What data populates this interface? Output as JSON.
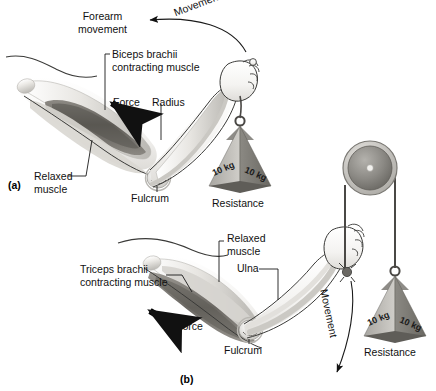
{
  "figure": {
    "background": "#ffffff",
    "ink": "#111111"
  },
  "panels": [
    {
      "id": "a",
      "label": "(a)",
      "description": "Biceps brachii contracting, forearm flexion, weight held in hand",
      "labels": [
        {
          "name": "forearm-movement",
          "text": "Forearm\nmovement"
        },
        {
          "name": "movement-arrow-label",
          "text": "Movement"
        },
        {
          "name": "biceps-brachii",
          "text": "Biceps brachii\ncontracting muscle"
        },
        {
          "name": "force",
          "text": "Force"
        },
        {
          "name": "radius",
          "text": "Radius"
        },
        {
          "name": "relaxed-muscle",
          "text": "Relaxed\nmuscle"
        },
        {
          "name": "fulcrum",
          "text": "Fulcrum"
        },
        {
          "name": "resistance",
          "text": "Resistance"
        }
      ],
      "weight": {
        "face_left": "10 kg",
        "face_right": "10 kg"
      }
    },
    {
      "id": "b",
      "label": "(b)",
      "description": "Triceps brachii contracting, forearm extension, cable over pulley to weight",
      "labels": [
        {
          "name": "triceps-brachii",
          "text": "Triceps brachii\ncontracting muscle"
        },
        {
          "name": "relaxed-muscle",
          "text": "Relaxed\nmuscle"
        },
        {
          "name": "ulna",
          "text": "Ulna"
        },
        {
          "name": "force",
          "text": "Force"
        },
        {
          "name": "fulcrum",
          "text": "Fulcrum"
        },
        {
          "name": "movement-arrow-label",
          "text": "Movement"
        },
        {
          "name": "resistance",
          "text": "Resistance"
        }
      ],
      "weight": {
        "face_left": "10 kg",
        "face_right": "10 kg"
      }
    }
  ],
  "colors": {
    "bone_light": "#f2f1ef",
    "bone_mid": "#cfcdc8",
    "muscle_dark": "#6e6b66",
    "muscle_mid": "#9a968f",
    "weight_light": "#b8b6b2",
    "weight_dark": "#77756f",
    "pulley_rim": "#cbc9c5",
    "pulley_face": "#8e8c88",
    "outline": "#3a3a38",
    "arrow": "#000000"
  }
}
